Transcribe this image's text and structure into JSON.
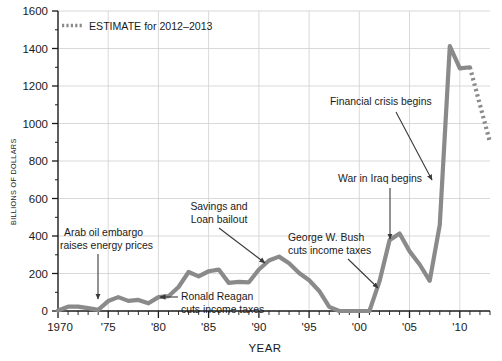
{
  "legend": {
    "label": "ESTIMATE for 2012–2013",
    "swatch_style": "dotted",
    "color": "#8a8a8a"
  },
  "axes": {
    "y_title": "BILLIONS OF DOLLARS",
    "x_title": "YEAR",
    "y_ticks": [
      "0",
      "200",
      "400",
      "600",
      "800",
      "1000",
      "1200",
      "1400",
      "1600"
    ],
    "x_ticks": [
      "1970",
      "'75",
      "'80",
      "'85",
      "'90",
      "'95",
      "'00",
      "'05",
      "'10"
    ]
  },
  "annotations": [
    {
      "id": "arab-oil-embargo",
      "line1": "Arab oil embargo",
      "line2": "raises energy prices"
    },
    {
      "id": "savings-loan-bailout",
      "line1": "Savings and",
      "line2": "Loan bailout"
    },
    {
      "id": "ronald-reagan-tax-cuts",
      "line1": "Ronald Reagan",
      "line2": "cuts income taxes"
    },
    {
      "id": "george-w-bush-tax-cuts",
      "line1": "George W. Bush",
      "line2": "cuts income taxes"
    },
    {
      "id": "war-in-iraq",
      "line1": "War in Iraq begins",
      "line2": ""
    },
    {
      "id": "financial-crisis",
      "line1": "Financial crisis begins",
      "line2": ""
    }
  ],
  "chart_data": {
    "type": "line",
    "title": "",
    "xlabel": "YEAR",
    "ylabel": "BILLIONS OF DOLLARS",
    "xlim": [
      1970,
      2013
    ],
    "ylim": [
      0,
      1600
    ],
    "ytick_step": 200,
    "xtick_step": 5,
    "minor_xtick_step": 1,
    "grid": true,
    "legend_position": "top-left",
    "line_color": "#8a8a8a",
    "series": [
      {
        "name": "Federal budget deficit",
        "style": "solid",
        "x": [
          1970,
          1971,
          1972,
          1973,
          1974,
          1975,
          1976,
          1977,
          1978,
          1979,
          1980,
          1981,
          1982,
          1983,
          1984,
          1985,
          1986,
          1987,
          1988,
          1989,
          1990,
          1991,
          1992,
          1993,
          1994,
          1995,
          1996,
          1997,
          1998,
          1999,
          2000,
          2001,
          2002,
          2003,
          2004,
          2005,
          2006,
          2007,
          2008,
          2009,
          2010,
          2011
        ],
        "values": [
          3,
          23,
          23,
          15,
          6,
          53,
          74,
          54,
          59,
          41,
          74,
          79,
          128,
          208,
          185,
          212,
          221,
          150,
          155,
          153,
          221,
          269,
          290,
          255,
          203,
          164,
          107,
          22,
          0,
          0,
          0,
          0,
          158,
          378,
          413,
          318,
          248,
          161,
          459,
          1413,
          1294,
          1300
        ]
      },
      {
        "name": "ESTIMATE for 2012–2013",
        "style": "dotted",
        "x": [
          2011,
          2012,
          2013
        ],
        "values": [
          1300,
          1100,
          900
        ]
      }
    ],
    "annotations": [
      {
        "text": "Arab oil embargo raises energy prices",
        "points_to_year": 1974,
        "points_to_value": 6
      },
      {
        "text": "Ronald Reagan cuts income taxes",
        "points_to_year": 1982,
        "points_to_value": 128
      },
      {
        "text": "Savings and Loan bailout",
        "points_to_year": 1992,
        "points_to_value": 290
      },
      {
        "text": "George W. Bush cuts income taxes",
        "points_to_year": 2002,
        "points_to_value": 158
      },
      {
        "text": "War in Iraq begins",
        "points_to_year": 2003,
        "points_to_value": 378
      },
      {
        "text": "Financial crisis begins",
        "points_to_year": 2008,
        "points_to_value": 459
      }
    ]
  }
}
